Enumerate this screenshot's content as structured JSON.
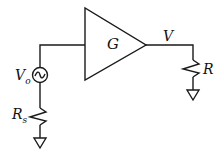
{
  "diagram": {
    "type": "circuit",
    "amplifier": {
      "label": "G"
    },
    "source": {
      "label": "V",
      "label_sub": "o",
      "symbol": "ac-source"
    },
    "source_resistor": {
      "label": "R",
      "label_sub": "s"
    },
    "output_node": {
      "label": "V"
    },
    "load_resistor": {
      "label": "R"
    },
    "colors": {
      "stroke": "#1a1a1a",
      "background": "#ffffff"
    }
  }
}
